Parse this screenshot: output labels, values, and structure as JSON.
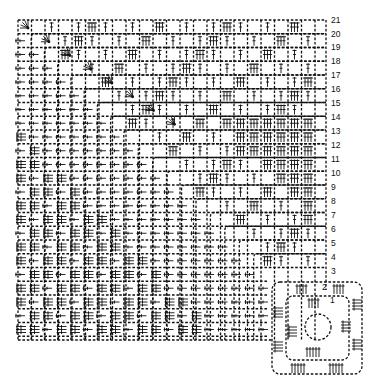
{
  "diagram": {
    "type": "crochet-chart",
    "colors": {
      "ink": "#111111",
      "background": "#ffffff"
    },
    "grid": {
      "x0": 18,
      "y0": 18,
      "cols": 23,
      "rows": 24,
      "pitch_x": 13.5,
      "pitch_y": 13.6
    },
    "row_labels": [
      {
        "text": "21",
        "y": 20
      },
      {
        "text": "20",
        "y": 34
      },
      {
        "text": "19",
        "y": 47
      },
      {
        "text": "18",
        "y": 61
      },
      {
        "text": "17",
        "y": 75
      },
      {
        "text": "16",
        "y": 89
      },
      {
        "text": "15",
        "y": 103
      },
      {
        "text": "14",
        "y": 117
      },
      {
        "text": "13",
        "y": 131
      },
      {
        "text": "12",
        "y": 145
      },
      {
        "text": "11",
        "y": 159
      },
      {
        "text": "10",
        "y": 173
      },
      {
        "text": "9",
        "y": 187
      },
      {
        "text": "8",
        "y": 201
      },
      {
        "text": "7",
        "y": 215
      },
      {
        "text": "6",
        "y": 229
      },
      {
        "text": "5",
        "y": 243
      },
      {
        "text": "4",
        "y": 257
      },
      {
        "text": "3",
        "y": 271
      }
    ],
    "motif_labels": [
      {
        "text": "2",
        "x": 322,
        "y": 287
      },
      {
        "text": "1",
        "x": 330,
        "y": 300
      }
    ],
    "legend_symbols": [
      "chain-dash",
      "double-crochet-cluster",
      "fan-corner",
      "circle-center"
    ]
  }
}
